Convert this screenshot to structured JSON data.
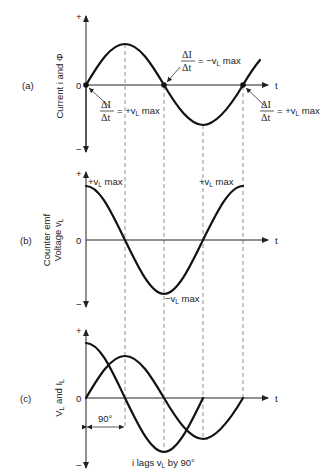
{
  "figure": {
    "panels": [
      {
        "id": "a",
        "tag": "(a)",
        "ylabel": "Current i and Φ",
        "plus": "+",
        "minus": "−",
        "zero": "0",
        "xlabel": "t",
        "annotations": {
          "left": {
            "num": "ΔI",
            "den": "Δt",
            "rhs": "= +v",
            "sub": "L",
            "tail": " max"
          },
          "mid": {
            "num": "ΔI",
            "den": "Δt",
            "rhs": "= −v",
            "sub": "L",
            "tail": " max"
          },
          "right": {
            "num": "ΔI",
            "den": "Δt",
            "rhs": "= +v",
            "sub": "L",
            "tail": " max"
          }
        }
      },
      {
        "id": "b",
        "tag": "(b)",
        "ylabel_line1": "Counter emf",
        "ylabel_line2": "Voltage v",
        "ylabel_sub": "L",
        "plus": "+",
        "minus": "−",
        "zero": "0",
        "xlabel": "t",
        "annotations": {
          "max_left": {
            "pre": "+v",
            "sub": "L",
            "tail": " max"
          },
          "max_right": {
            "pre": "+v",
            "sub": "L",
            "tail": " max"
          },
          "min": {
            "pre": "−v",
            "sub": "L",
            "tail": " max"
          }
        }
      },
      {
        "id": "c",
        "tag": "(c)",
        "ylabel_a": "V",
        "ylabel_a_sub": "L",
        "ylabel_mid": " and I",
        "ylabel_b_sub": "L",
        "plus": "+",
        "minus": "−",
        "zero": "0",
        "xlabel": "t",
        "phase_label": "90°",
        "caption_pre": "i lags v",
        "caption_sub": "L",
        "caption_post": " by 90°"
      }
    ]
  }
}
